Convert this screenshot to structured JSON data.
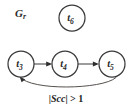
{
  "figure": {
    "name": "directed-graph-Gr",
    "background_color": "#ffffff",
    "stroke_color": "#3a3a3a",
    "text_color": "#2b2b2b",
    "graph_label": {
      "base": "G",
      "subscript": "r"
    }
  },
  "nodes": [
    {
      "id": "t6",
      "base": "t",
      "subscript": "6",
      "cx": 72,
      "cy": 18,
      "r": 13
    },
    {
      "id": "t3",
      "base": "t",
      "subscript": "3",
      "cx": 21,
      "cy": 64,
      "r": 13
    },
    {
      "id": "t4",
      "base": "t",
      "subscript": "4",
      "cx": 65,
      "cy": 64,
      "r": 13
    },
    {
      "id": "t5",
      "base": "t",
      "subscript": "5",
      "cx": 112,
      "cy": 64,
      "r": 13
    }
  ],
  "edges": [
    {
      "id": "t3-to-t4",
      "from": "t3",
      "to": "t4",
      "shape": "straight",
      "directed": true
    },
    {
      "id": "t4-to-t5",
      "from": "t4",
      "to": "t5",
      "shape": "straight",
      "directed": true
    },
    {
      "id": "t5-to-t3",
      "from": "t5",
      "to": "t3",
      "shape": "curved-arc-below",
      "directed": true,
      "label": {
        "bar_open": "|",
        "term": "Scc",
        "bar_close": "|",
        "relation": " > 1"
      }
    }
  ]
}
